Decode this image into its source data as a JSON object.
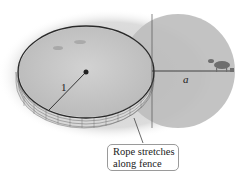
{
  "diagram": {
    "labels": {
      "radius": "1",
      "rope_length": "a"
    },
    "callout": {
      "line1": "Rope stretches",
      "line2": "along fence"
    },
    "colors": {
      "fence_ring": "#2a2a2a",
      "ground": "#c9c9c9",
      "grazing_area": "#bdbdbd",
      "lines": "#333333"
    }
  }
}
